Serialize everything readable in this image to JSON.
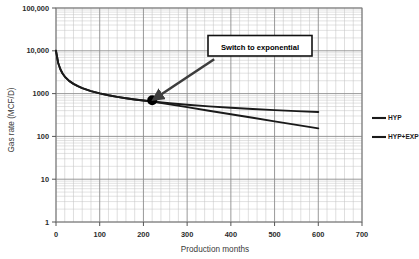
{
  "chart_data": {
    "type": "line",
    "title": "",
    "xlabel": "Production months",
    "ylabel": "Gas rate (MCF/D)",
    "xlim": [
      0,
      700
    ],
    "ylim": [
      1,
      100000
    ],
    "yscale": "log",
    "xscale": "linear",
    "grid": true,
    "grid_minor": true,
    "legend_position": "right",
    "xticks": [
      0,
      100,
      200,
      300,
      400,
      500,
      600,
      700
    ],
    "xtick_labels": [
      "0",
      "100",
      "200",
      "300",
      "400",
      "500",
      "600",
      "700"
    ],
    "yticks": [
      1,
      10,
      100,
      1000,
      10000,
      100000
    ],
    "ytick_labels": [
      "1",
      "10",
      "100",
      "1000",
      "10,000",
      "100,000"
    ],
    "series": [
      {
        "name": "HYP",
        "color": "#1a1a1a",
        "points": [
          [
            0,
            10000
          ],
          [
            5,
            5200
          ],
          [
            10,
            3700
          ],
          [
            15,
            2950
          ],
          [
            20,
            2500
          ],
          [
            30,
            1980
          ],
          [
            40,
            1690
          ],
          [
            50,
            1490
          ],
          [
            60,
            1345
          ],
          [
            80,
            1145
          ],
          [
            100,
            1010
          ],
          [
            120,
            915
          ],
          [
            140,
            840
          ],
          [
            160,
            780
          ],
          [
            180,
            730
          ],
          [
            200,
            688
          ],
          [
            220,
            652
          ],
          [
            260,
            594
          ],
          [
            300,
            548
          ],
          [
            350,
            503
          ],
          [
            400,
            467
          ],
          [
            450,
            437
          ],
          [
            500,
            412
          ],
          [
            550,
            390
          ],
          [
            600,
            371
          ]
        ]
      },
      {
        "name": "HYP+EXP",
        "color": "#1a1a1a",
        "points": [
          [
            0,
            10000
          ],
          [
            5,
            5200
          ],
          [
            10,
            3700
          ],
          [
            15,
            2950
          ],
          [
            20,
            2500
          ],
          [
            30,
            1980
          ],
          [
            40,
            1690
          ],
          [
            50,
            1490
          ],
          [
            60,
            1345
          ],
          [
            80,
            1145
          ],
          [
            100,
            1010
          ],
          [
            120,
            915
          ],
          [
            140,
            840
          ],
          [
            160,
            780
          ],
          [
            180,
            730
          ],
          [
            200,
            688
          ],
          [
            220,
            652
          ],
          [
            260,
            560
          ],
          [
            300,
            482
          ],
          [
            350,
            398
          ],
          [
            400,
            329
          ],
          [
            450,
            272
          ],
          [
            500,
            225
          ],
          [
            550,
            186
          ],
          [
            600,
            154
          ]
        ]
      }
    ],
    "annotations": [
      {
        "text": "Switch to exponential",
        "type": "boxed-callout-with-arrow",
        "box_x": 340,
        "box_y": 17000,
        "arrow_target_x": 220,
        "arrow_target_y": 700
      }
    ],
    "markers": [
      {
        "name": "switch-point",
        "x": 220,
        "y": 700,
        "shape": "circle",
        "color": "#000000"
      }
    ]
  },
  "legend": {
    "items": [
      {
        "label": "HYP"
      },
      {
        "label": "HYP+EXP"
      }
    ]
  },
  "axes": {
    "x_title": "Production months",
    "y_title": "Gas rate (MCF/D)",
    "x_labels": [
      "0",
      "100",
      "200",
      "300",
      "400",
      "500",
      "600",
      "700"
    ],
    "y_labels": [
      "100,000",
      "10,000",
      "1000",
      "100",
      "10",
      "1"
    ]
  },
  "annotation": {
    "text": "Switch to exponential"
  },
  "colors": {
    "curve": "#1a1a1a",
    "grid_major": "#8d8d8d",
    "grid_minor": "#c4c4c4",
    "axis": "#6f6f6f",
    "background": "#ffffff",
    "annotation_border": "#111111"
  }
}
